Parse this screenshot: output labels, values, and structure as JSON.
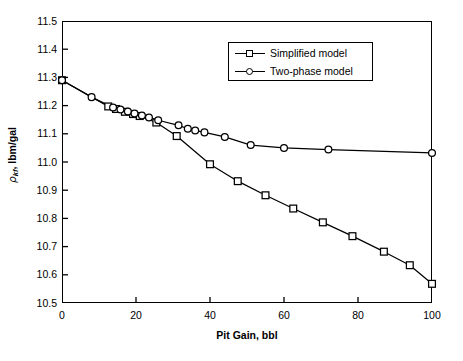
{
  "figure": {
    "background": "#ffffff",
    "foreground": "#000000",
    "caption": ""
  },
  "axes": {
    "x_title": "Pit Gain, bbl",
    "y_title_symbol": "ρ",
    "y_title_subscript": "kf",
    "y_title_unit": ", lbm/gal",
    "x_ticks": [
      "0",
      "20",
      "40",
      "60",
      "80",
      "100"
    ],
    "y_ticks": [
      "11.5",
      "11.4",
      "11.3",
      "11.2",
      "11.1",
      "11.0",
      "10.9",
      "10.8",
      "10.7",
      "10.6",
      "10.5"
    ]
  },
  "legend": {
    "entries": [
      {
        "label": "Simplified model",
        "marker": "square"
      },
      {
        "label": "Two-phase model",
        "marker": "circle"
      }
    ]
  },
  "chart_data": {
    "type": "line",
    "title": "",
    "xlabel": "Pit Gain, bbl",
    "ylabel": "ρkf, lbm/gal",
    "xlim": [
      0,
      100
    ],
    "ylim": [
      10.5,
      11.5
    ],
    "xtick_step": 20,
    "ytick_step": 0.1,
    "grid": false,
    "legend_position": "upper-right-inside",
    "series": [
      {
        "name": "Simplified model",
        "marker": "square",
        "color": "#000000",
        "points": [
          [
            0.0,
            11.29
          ],
          [
            12.5,
            11.197
          ],
          [
            14.6,
            11.188
          ],
          [
            17.0,
            11.178
          ],
          [
            19.2,
            11.17
          ],
          [
            21.0,
            11.163
          ],
          [
            25.5,
            11.14
          ],
          [
            31.0,
            11.092
          ],
          [
            40.0,
            10.992
          ],
          [
            47.5,
            10.932
          ],
          [
            55.0,
            10.882
          ],
          [
            62.5,
            10.835
          ],
          [
            70.5,
            10.786
          ],
          [
            78.5,
            10.737
          ],
          [
            87.0,
            10.682
          ],
          [
            94.0,
            10.634
          ],
          [
            100.0,
            10.568
          ]
        ]
      },
      {
        "name": "Two-phase model",
        "marker": "circle",
        "color": "#000000",
        "points": [
          [
            0.0,
            11.29
          ],
          [
            8.0,
            11.23
          ],
          [
            13.8,
            11.193
          ],
          [
            15.8,
            11.186
          ],
          [
            17.8,
            11.179
          ],
          [
            19.6,
            11.172
          ],
          [
            21.6,
            11.165
          ],
          [
            23.5,
            11.158
          ],
          [
            26.0,
            11.148
          ],
          [
            31.5,
            11.13
          ],
          [
            34.0,
            11.118
          ],
          [
            36.0,
            11.112
          ],
          [
            38.5,
            11.105
          ],
          [
            44.0,
            11.089
          ],
          [
            51.0,
            11.06
          ],
          [
            60.0,
            11.05
          ],
          [
            72.0,
            11.044
          ],
          [
            100.0,
            11.032
          ]
        ]
      }
    ]
  }
}
